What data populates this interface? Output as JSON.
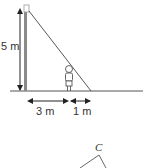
{
  "diagram": {
    "labels": {
      "height": "5 m",
      "distance_to_person": "3 m",
      "shadow_length": "1 m",
      "vertex_c": "C"
    },
    "elements": [
      "lamp-post",
      "person",
      "ground-line",
      "light-ray",
      "dimension-arrows",
      "triangle"
    ],
    "colors": {
      "line": "#444444",
      "post": "#888888"
    }
  }
}
